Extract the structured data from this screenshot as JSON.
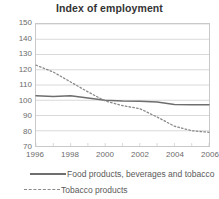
{
  "chart_data": {
    "type": "line",
    "title": "Index of employment",
    "xlabel": "",
    "ylabel": "",
    "x": [
      1996,
      1997,
      1998,
      1999,
      2000,
      2001,
      2002,
      2003,
      2004,
      2005,
      2006
    ],
    "xlim": [
      1996,
      2006
    ],
    "ylim": [
      70,
      150
    ],
    "y_ticks": [
      70,
      80,
      90,
      100,
      110,
      120,
      130,
      140,
      150
    ],
    "x_ticks": [
      1996,
      1998,
      2000,
      2002,
      2004,
      2006
    ],
    "x_tick_labels": [
      "1996",
      "1998",
      "2000",
      "2002",
      "2004",
      "2006"
    ],
    "y_tick_labels": [
      "70",
      "80",
      "90",
      "100",
      "110",
      "120",
      "130",
      "140",
      "150"
    ],
    "grid": true,
    "legend_position": "bottom-left",
    "series": [
      {
        "name": "Food products, beverages and tobacco",
        "style": "solid",
        "color": "#6e6e6e",
        "values": [
          103.0,
          102.5,
          103.0,
          101.5,
          100.0,
          99.5,
          99.3,
          98.8,
          97.2,
          97.0,
          97.0
        ]
      },
      {
        "name": "Tobacco products",
        "style": "dotted",
        "color": "#8a8a8a",
        "values": [
          123.0,
          118.5,
          112.0,
          105.5,
          99.5,
          96.5,
          94.5,
          89.0,
          83.0,
          80.0,
          79.0
        ]
      }
    ]
  },
  "legend": {
    "items": [
      {
        "label": "Food products, beverages and tobacco"
      },
      {
        "label": "Tobacco products"
      }
    ]
  }
}
